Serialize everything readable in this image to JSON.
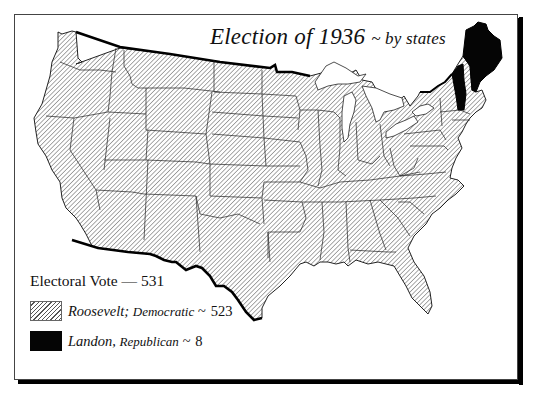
{
  "map": {
    "title": "Election of 1936",
    "subtitle": "~ by states",
    "colors": {
      "democratic_hatch": "#555555",
      "republican_fill": "#050505",
      "background": "#ffffff",
      "frame_shadow": "#000000"
    }
  },
  "legend": {
    "total_label": "Electoral Vote",
    "total_sep": "—",
    "total_value": "531",
    "entries": [
      {
        "candidate": "Roosevelt;",
        "party": "Democratic",
        "sep": "~",
        "votes": "523",
        "swatch": "hatched"
      },
      {
        "candidate": "Landon,",
        "party": "Republican",
        "sep": "~",
        "votes": "8",
        "swatch": "solid-black"
      }
    ]
  },
  "states": {
    "republican": [
      "Maine",
      "Vermont"
    ],
    "democratic": "all other states"
  }
}
